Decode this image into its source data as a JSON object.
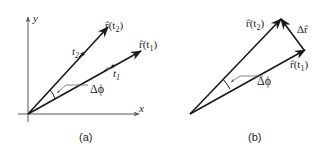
{
  "panels": [
    {
      "id": "a",
      "caption": "(a)",
      "axes": {
        "x_label": "x",
        "y_label": "y"
      },
      "vectors": [
        {
          "name": "r_hat_t2",
          "label_main": "r̂(t",
          "label_sub": "2",
          "label_end": ")"
        },
        {
          "name": "r_hat_t1",
          "label_main": "r̂(t",
          "label_sub": "1",
          "label_end": ")"
        }
      ],
      "points": [
        {
          "label_main": "t",
          "label_sub": "2"
        },
        {
          "label_main": "t",
          "label_sub": "1"
        }
      ],
      "angle_label": "Δϕ"
    },
    {
      "id": "b",
      "caption": "(b)",
      "vectors": [
        {
          "name": "r_hat_t2",
          "label_main": "r̂(t",
          "label_sub": "2",
          "label_end": ")"
        },
        {
          "name": "r_hat_t1",
          "label_main": "r̂(t",
          "label_sub": "1",
          "label_end": ")"
        },
        {
          "name": "delta_r_hat",
          "label": "Δr̂"
        }
      ],
      "angle_label": "Δϕ"
    }
  ],
  "colors": {
    "line": "#1a1a1a",
    "axis": "#555555",
    "leader": "#666666"
  }
}
